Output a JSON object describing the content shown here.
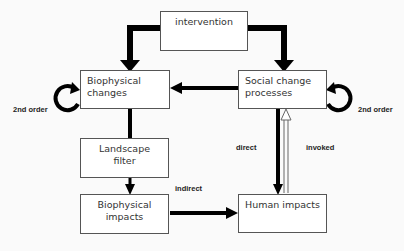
{
  "diagram": {
    "nodes": {
      "intervention": "intervention",
      "biophysical_changes": "Biophysical changes",
      "social_change": "Social change processes",
      "landscape_filter": "Landscape filter",
      "biophysical_impacts": "Biophysical impacts",
      "human_impacts": "Human impacts"
    },
    "labels": {
      "second_order_left": "2nd order",
      "second_order_right": "2nd order",
      "direct": "direct",
      "invoked": "invoked",
      "indirect": "indirect"
    },
    "edges": [
      {
        "from": "intervention",
        "to": "biophysical_changes"
      },
      {
        "from": "intervention",
        "to": "social_change"
      },
      {
        "from": "social_change",
        "to": "biophysical_changes"
      },
      {
        "from": "biophysical_changes",
        "to": "landscape_filter"
      },
      {
        "from": "landscape_filter",
        "to": "biophysical_impacts"
      },
      {
        "from": "biophysical_impacts",
        "to": "human_impacts",
        "label": "indirect"
      },
      {
        "from": "social_change",
        "to": "human_impacts",
        "label": "direct"
      },
      {
        "from": "human_impacts",
        "to": "social_change",
        "label": "invoked"
      },
      {
        "from": "biophysical_changes",
        "to": "biophysical_changes",
        "label": "2nd order"
      },
      {
        "from": "social_change",
        "to": "social_change",
        "label": "2nd order"
      }
    ]
  }
}
